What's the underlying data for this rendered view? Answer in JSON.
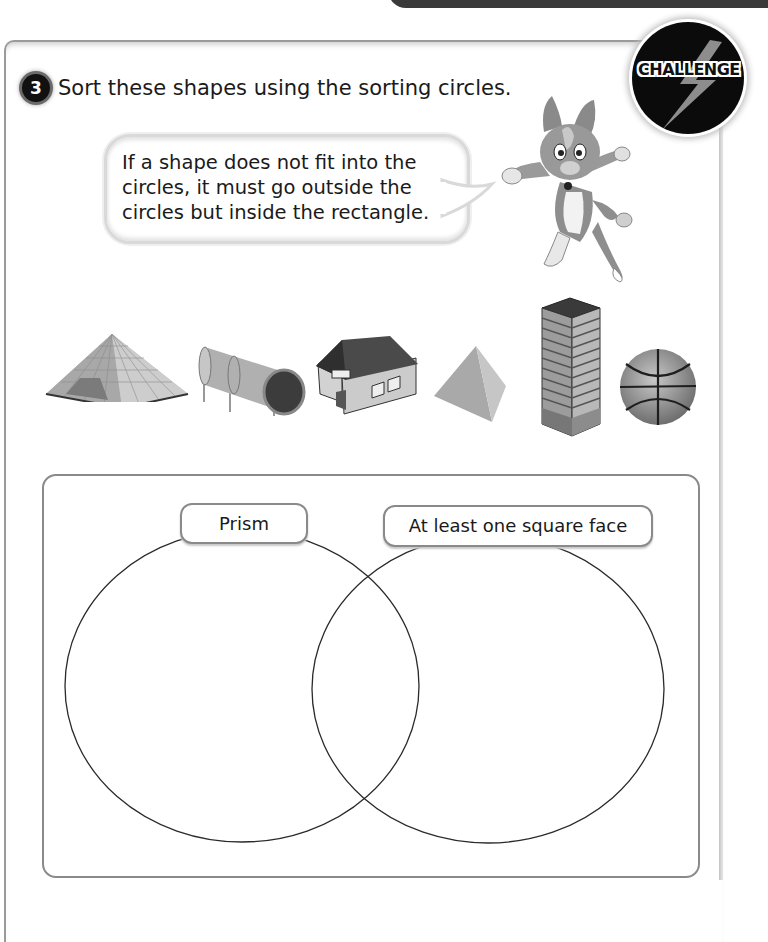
{
  "question": {
    "number": "3",
    "text": "Sort these shapes using the sorting circles."
  },
  "badge": {
    "label": "CHALLENGE",
    "icon": "lightning-bolt-icon"
  },
  "speech_bubble": {
    "lines": [
      "If a shape does not fit into the",
      "circles, it must go outside the",
      "circles but inside the rectangle."
    ]
  },
  "mascot": {
    "description": "cartoon cat character"
  },
  "shapes": [
    {
      "name": "glass-pyramid",
      "type": "square-based pyramid"
    },
    {
      "name": "tunnel-slide",
      "type": "cylinder"
    },
    {
      "name": "house",
      "type": "prism with roof"
    },
    {
      "name": "tetrahedron",
      "type": "triangular-based pyramid"
    },
    {
      "name": "skyscraper",
      "type": "cuboid / square prism"
    },
    {
      "name": "basketball",
      "type": "sphere"
    }
  ],
  "sorting_diagram": {
    "circles": [
      {
        "label": "Prism"
      },
      {
        "label": "At least one square face"
      }
    ]
  },
  "colors": {
    "ink": "#1a1a1a",
    "border": "#8a8a8a",
    "badge_bg": "#0b0b0b"
  }
}
